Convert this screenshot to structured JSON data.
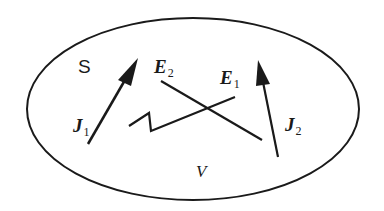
{
  "diagram": {
    "region_surface_label": "S",
    "region_volume_label": "V",
    "current_sources": [
      {
        "symbol": "J",
        "subscript": "1",
        "from": [
          88,
          144
        ],
        "to": [
          138,
          58
        ]
      },
      {
        "symbol": "J",
        "subscript": "2",
        "from": [
          278,
          157
        ],
        "to": [
          258,
          60
        ]
      }
    ],
    "fields": [
      {
        "symbol": "E",
        "subscript": "2",
        "path": [
          [
            161,
            81
          ],
          [
            262,
            140
          ]
        ]
      },
      {
        "symbol": "E",
        "subscript": "1",
        "path": [
          [
            129,
            126
          ],
          [
            149,
            113
          ],
          [
            151,
            131
          ],
          [
            235,
            97
          ]
        ]
      }
    ],
    "colors": {
      "stroke": "#1a1a1a",
      "background": "#ffffff"
    }
  }
}
